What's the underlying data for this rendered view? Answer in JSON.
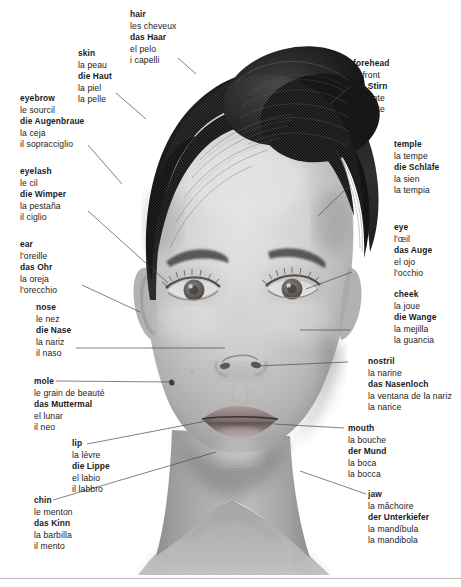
{
  "figure": {
    "languages": [
      "English",
      "French",
      "German",
      "Spanish",
      "Italian"
    ],
    "background_color": "#ffffff",
    "text_color": "#1b1b1b",
    "leader_line_color": "#4a4a4a",
    "rule_color": "#b9b9b9"
  },
  "labels": [
    {
      "id": "hair",
      "en": "hair",
      "fr": "les cheveux",
      "de": "das Haar",
      "es": "el pelo",
      "it": "i capelli"
    },
    {
      "id": "skin",
      "en": "skin",
      "fr": "la peau",
      "de": "die Haut",
      "es": "la piel",
      "it": "la pelle"
    },
    {
      "id": "eyebrow",
      "en": "eyebrow",
      "fr": "le sourcil",
      "de": "die Augenbraue",
      "es": "la ceja",
      "it": "il sopracciglio"
    },
    {
      "id": "eyelash",
      "en": "eyelash",
      "fr": "le cil",
      "de": "die Wimper",
      "es": "la pestaña",
      "it": "il ciglio"
    },
    {
      "id": "ear",
      "en": "ear",
      "fr": "l'oreille",
      "de": "das Ohr",
      "es": "la oreja",
      "it": "l'orecchio"
    },
    {
      "id": "nose",
      "en": "nose",
      "fr": "le nez",
      "de": "die Nase",
      "es": "la nariz",
      "it": "il naso"
    },
    {
      "id": "mole",
      "en": "mole",
      "fr": "le grain de beauté",
      "de": "das Muttermal",
      "es": "el lunar",
      "it": "il neo"
    },
    {
      "id": "lip",
      "en": "lip",
      "fr": "la lèvre",
      "de": "die Lippe",
      "es": "el labio",
      "it": "il labbro"
    },
    {
      "id": "chin",
      "en": "chin",
      "fr": "le menton",
      "de": "das Kinn",
      "es": "la barbilla",
      "it": "il mento"
    },
    {
      "id": "forehead",
      "en": "forehead",
      "fr": "le front",
      "de": "die Stirn",
      "es": "la frente",
      "it": "la fronte"
    },
    {
      "id": "temple",
      "en": "temple",
      "fr": "la tempe",
      "de": "die Schläfe",
      "es": "la sien",
      "it": "la tempia"
    },
    {
      "id": "eye",
      "en": "eye",
      "fr": "l'œil",
      "de": "das Auge",
      "es": "el ojo",
      "it": "l'occhio"
    },
    {
      "id": "cheek",
      "en": "cheek",
      "fr": "la joue",
      "de": "die Wange",
      "es": "la mejilla",
      "it": "la guancia"
    },
    {
      "id": "nostril",
      "en": "nostril",
      "fr": "la narine",
      "de": "das Nasenloch",
      "es": "la ventana de la nariz",
      "it": "la narice"
    },
    {
      "id": "mouth",
      "en": "mouth",
      "fr": "la bouche",
      "de": "der Mund",
      "es": "la boca",
      "it": "la bocca"
    },
    {
      "id": "jaw",
      "en": "jaw",
      "fr": "la mâchoire",
      "de": "der Unterkiefer",
      "es": "la mandíbula",
      "it": "la mandibola"
    }
  ]
}
